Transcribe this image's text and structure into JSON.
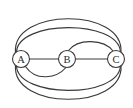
{
  "figure": {
    "type": "multigraph-diagram",
    "background_color": "#ffffff",
    "stroke_color": "#3a3a3a",
    "node_fill_color": "#ffffff",
    "width": 133,
    "height": 108
  },
  "graph": {
    "nodes": [
      {
        "id": "A",
        "label": "A",
        "cx": 21,
        "cy": 59,
        "r": 8.5
      },
      {
        "id": "B",
        "label": "B",
        "cx": 67,
        "cy": 59,
        "r": 8.5
      },
      {
        "id": "C",
        "label": "C",
        "cx": 116,
        "cy": 59,
        "r": 8.5
      }
    ],
    "edges": [
      {
        "id": "e1",
        "from": "A",
        "to": "B",
        "shape": "straight",
        "path": "M 29.5 59 L 58.5 59"
      },
      {
        "id": "e2",
        "from": "B",
        "to": "C",
        "shape": "straight",
        "path": "M 75.5 59 L 107.5 59"
      },
      {
        "id": "e3",
        "from": "A",
        "to": "B",
        "shape": "arc-below",
        "path": "M 25.5 66.5 C 36 82 57 78 66 67.5"
      },
      {
        "id": "e4",
        "from": "B",
        "to": "C",
        "shape": "arc-above",
        "path": "M 68.5 50.5 C 78 38 104 39 113 51"
      },
      {
        "id": "e5",
        "from": "A",
        "to": "C",
        "shape": "arc-above-outer",
        "path": "M 15.5 52.5 C 12 8 124 7 121 52.5"
      },
      {
        "id": "e6",
        "from": "A",
        "to": "C",
        "shape": "arc-above-inner",
        "path": "M 16.5 52 C 18 20 118 19 120.5 52"
      },
      {
        "id": "e7",
        "from": "A",
        "to": "C",
        "shape": "arc-below-inner",
        "path": "M 16.5 66 C 18 98 118 99 120.5 66"
      },
      {
        "id": "e8",
        "from": "A",
        "to": "C",
        "shape": "arc-below-outer",
        "path": "M 15.5 65.5 C 12 110 124 111 121 65.5"
      }
    ],
    "edge_count": 8,
    "node_count": 3
  }
}
